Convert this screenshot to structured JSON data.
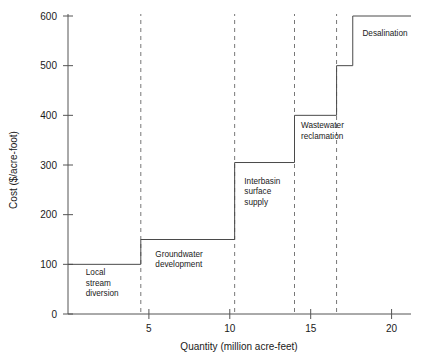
{
  "chart_data": {
    "type": "line",
    "title": "",
    "xlabel": "Quantity (million acre-feet)",
    "ylabel": "Cost ($/acre-foot)",
    "xlim": [
      0,
      21.2
    ],
    "ylim": [
      0,
      600
    ],
    "grid": false,
    "legend": "none",
    "step_shape": "hv",
    "xticks": [
      5,
      10,
      15,
      20
    ],
    "xticklabels": [
      "5",
      "10",
      "15",
      "20"
    ],
    "yticks": [
      0,
      100,
      200,
      300,
      400,
      500,
      600
    ],
    "yticklabels": [
      "0",
      "100",
      "200",
      "300",
      "400",
      "500",
      "600"
    ],
    "steps": [
      {
        "label": "Local stream diversion",
        "x_start": 0.0,
        "x_end": 4.5,
        "cost": 100
      },
      {
        "label": "Groundwater development",
        "x_start": 4.5,
        "x_end": 10.3,
        "cost": 150
      },
      {
        "label": "Interbasin surface supply",
        "x_start": 10.3,
        "x_end": 14.0,
        "cost": 305
      },
      {
        "label": "Wastewater reclamation",
        "x_start": 14.0,
        "x_end": 16.6,
        "cost": 400
      },
      {
        "label": "",
        "x_start": 16.6,
        "x_end": 17.6,
        "cost": 500
      },
      {
        "label": "Desalination",
        "x_start": 17.6,
        "x_end": 21.2,
        "cost": 600
      }
    ],
    "x": [
      0,
      4.5,
      4.5,
      10.3,
      10.3,
      14.0,
      14.0,
      16.6,
      16.6,
      17.6,
      17.6,
      21.2
    ],
    "y": [
      100,
      100,
      150,
      150,
      305,
      305,
      400,
      400,
      500,
      500,
      600,
      600
    ],
    "dashed_boundaries": [
      4.5,
      10.3,
      14.0,
      16.6
    ],
    "annotations": [
      {
        "text_lines": [
          "Local",
          "stream",
          "diversion"
        ],
        "x": 1.1,
        "y": 78
      },
      {
        "text_lines": [
          "Groundwater",
          "development"
        ],
        "x": 5.4,
        "y": 115
      },
      {
        "text_lines": [
          "Interbasin",
          "surface",
          "supply"
        ],
        "x": 10.9,
        "y": 262
      },
      {
        "text_lines": [
          "Wastewater",
          "reclamation"
        ],
        "x": 14.4,
        "y": 374
      },
      {
        "text_lines": [
          "Desalination"
        ],
        "x": 18.2,
        "y": 560
      }
    ],
    "colors": {
      "line": "#4a4a4a",
      "axis": "#555555",
      "dashed": "#777777",
      "text": "#1a1a1a",
      "background": "#ffffff"
    }
  }
}
